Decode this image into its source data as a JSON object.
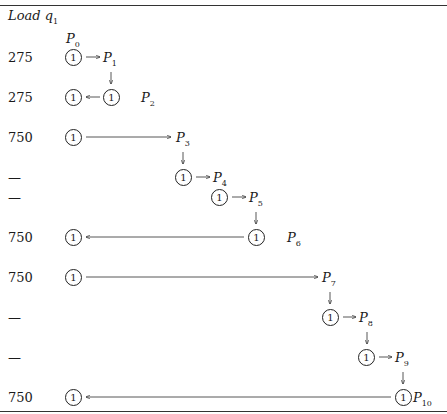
{
  "title": "Load q",
  "title_sub": "1",
  "node_label": "1",
  "rows": [
    {
      "label": "275"
    },
    {
      "label": "275"
    },
    {
      "label": "750"
    },
    {
      "label": "—"
    },
    {
      "label": "—"
    },
    {
      "label": "750"
    },
    {
      "label": "750"
    },
    {
      "label": "—"
    },
    {
      "label": "—"
    },
    {
      "label": "750"
    }
  ],
  "points": [
    {
      "name": "P",
      "sub": "0"
    },
    {
      "name": "P",
      "sub": "1"
    },
    {
      "name": "P",
      "sub": "2"
    },
    {
      "name": "P",
      "sub": "3"
    },
    {
      "name": "P",
      "sub": "4"
    },
    {
      "name": "P",
      "sub": "5"
    },
    {
      "name": "P",
      "sub": "6"
    },
    {
      "name": "P",
      "sub": "7"
    },
    {
      "name": "P",
      "sub": "8"
    },
    {
      "name": "P",
      "sub": "9"
    },
    {
      "name": "P",
      "sub": "10"
    }
  ]
}
